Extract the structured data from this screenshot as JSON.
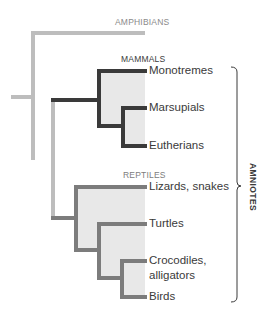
{
  "colors": {
    "amphibian_lineage": "#bdbdbd",
    "mammal_lineage": "#3a3a3a",
    "reptile_lineage": "#7c7c7c",
    "clade_fill": "#e8e8e8",
    "text": "#3a3a3a",
    "group_label_amphibians": "#8a8a8a",
    "group_label_mammals": "#3a3a3a",
    "group_label_reptiles": "#7c7c7c"
  },
  "groups": {
    "amphibians": "AMPHIBIANS",
    "mammals": "MAMMALS",
    "reptiles": "REPTILES"
  },
  "taxa": [
    {
      "label": "Monotremes",
      "group": "mammals"
    },
    {
      "label": "Marsupials",
      "group": "mammals"
    },
    {
      "label": "Eutherians",
      "group": "mammals"
    },
    {
      "label": "Lizards, snakes",
      "group": "reptiles"
    },
    {
      "label": "Turtles",
      "group": "reptiles"
    },
    {
      "label": "Crocodiles,",
      "label_line2": "alligators",
      "group": "reptiles"
    },
    {
      "label": "Birds",
      "group": "reptiles"
    }
  ],
  "bracket": {
    "label": "AMNIOTES"
  }
}
